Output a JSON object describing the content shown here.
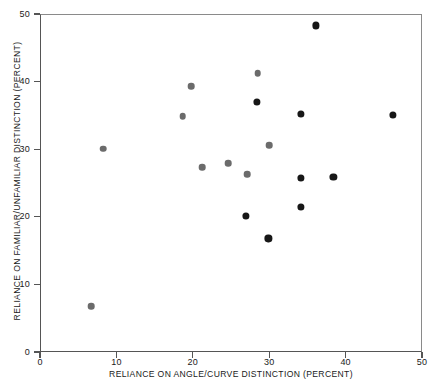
{
  "chart": {
    "type": "scatter",
    "xlabel": "RELIANCE ON ANGLE/CURVE DISTINCTION (PERCENT)",
    "ylabel": "RELIANCE ON FAMILIAR/UNFAMILIAR DISTINCTION (PERCENT)",
    "title": "",
    "xticks": [
      "0",
      "10",
      "20",
      "30",
      "40",
      "50"
    ],
    "yticks": [
      "0",
      "10",
      "20",
      "30",
      "40",
      "50"
    ]
  },
  "chart_data": {
    "type": "scatter",
    "title": "",
    "xlabel": "RELIANCE ON ANGLE/CURVE DISTINCTION (PERCENT)",
    "ylabel": "RELIANCE ON FAMILIAR/UNFAMILIAR DISTINCTION (PERCENT)",
    "xlim": [
      0,
      50
    ],
    "ylim": [
      0,
      50
    ],
    "xticks": [
      0,
      10,
      20,
      30,
      40,
      50
    ],
    "yticks": [
      0,
      10,
      20,
      30,
      40,
      50
    ],
    "grid": false,
    "legend": "none",
    "colors": {
      "grey_marker": "#6b6b6b",
      "dark_marker": "#171717",
      "axis": "#555555"
    },
    "series": [
      {
        "name": "grey",
        "color": "#6b6b6b",
        "marker": "filled-circle",
        "points": [
          {
            "x": 6.7,
            "y": 6.8
          },
          {
            "x": 8.3,
            "y": 30.1
          },
          {
            "x": 18.7,
            "y": 34.9
          },
          {
            "x": 19.8,
            "y": 39.3
          },
          {
            "x": 21.2,
            "y": 27.3
          },
          {
            "x": 24.6,
            "y": 27.9
          },
          {
            "x": 27.1,
            "y": 26.3
          },
          {
            "x": 28.5,
            "y": 41.2
          },
          {
            "x": 30.0,
            "y": 30.6
          }
        ]
      },
      {
        "name": "dark",
        "color": "#171717",
        "marker": "filled-circle",
        "points": [
          {
            "x": 27.0,
            "y": 20.1
          },
          {
            "x": 28.4,
            "y": 37.0
          },
          {
            "x": 29.9,
            "y": 16.8
          },
          {
            "x": 34.2,
            "y": 35.2
          },
          {
            "x": 34.2,
            "y": 25.8
          },
          {
            "x": 34.2,
            "y": 21.5
          },
          {
            "x": 36.1,
            "y": 48.3
          },
          {
            "x": 38.4,
            "y": 25.9
          },
          {
            "x": 46.2,
            "y": 35.1
          }
        ]
      }
    ]
  }
}
